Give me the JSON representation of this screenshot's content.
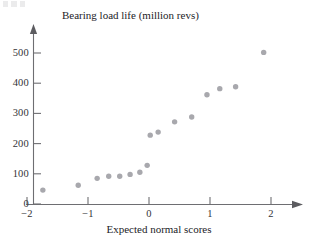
{
  "figure": {
    "corner_artifact": "faint-scan-marks"
  },
  "chart_data": {
    "type": "scatter",
    "title": "",
    "xlabel": "Expected normal scores",
    "ylabel": "Bearing load life (million revs)",
    "xlim": [
      -2.35,
      2.55
    ],
    "ylim": [
      0,
      560
    ],
    "grid": false,
    "legend": null,
    "xticks": [
      -2,
      -1,
      0,
      1,
      2
    ],
    "xticklabels": [
      "−2",
      "−1",
      "0",
      "1",
      "2"
    ],
    "yticks": [
      0,
      100,
      200,
      300,
      400,
      500
    ],
    "yticklabels": [
      "0",
      "100",
      "200",
      "300",
      "400",
      "500"
    ],
    "x": [
      -1.74,
      -1.16,
      -0.85,
      -0.66,
      -0.48,
      -0.31,
      -0.15,
      -0.03,
      0.02,
      0.15,
      0.42,
      0.7,
      0.95,
      1.16,
      1.42,
      1.88
    ],
    "y": [
      46,
      62,
      85,
      92,
      92,
      98,
      105,
      128,
      228,
      238,
      272,
      288,
      362,
      382,
      388,
      502
    ],
    "marker": {
      "shape": "circle",
      "color": "#a8a8ad",
      "radius": 2.7
    },
    "axis_color": "#6e6e72",
    "text_color": "#232327"
  }
}
